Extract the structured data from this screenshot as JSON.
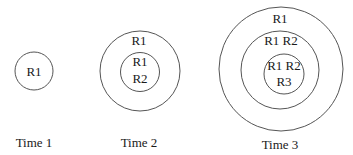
{
  "diagram": {
    "type": "nested-circles",
    "panels": [
      {
        "caption": "Time 1",
        "rings": [
          {
            "level": "outer",
            "labels": [
              "R1"
            ]
          }
        ]
      },
      {
        "caption": "Time 2",
        "rings": [
          {
            "level": "outer",
            "labels": [
              "R1"
            ]
          },
          {
            "level": "inner",
            "labels": [
              "R1",
              "R2"
            ]
          }
        ]
      },
      {
        "caption": "Time 3",
        "rings": [
          {
            "level": "outer",
            "labels": [
              "R1"
            ]
          },
          {
            "level": "middle",
            "labels": [
              "R1 R2"
            ]
          },
          {
            "level": "inner",
            "labels": [
              "R1 R2",
              "R3"
            ]
          }
        ]
      }
    ],
    "colors": {
      "stroke": "#555555",
      "text": "#1a1a1a",
      "background": "#ffffff"
    }
  },
  "text": {
    "t1_r1": "R1",
    "t1_caption": "Time 1",
    "t2_outer": "R1",
    "t2_inner_1": "R1",
    "t2_inner_2": "R2",
    "t2_caption": "Time 2",
    "t3_outer": "R1",
    "t3_middle": "R1 R2",
    "t3_inner_1": "R1 R2",
    "t3_inner_2": "R3",
    "t3_caption": "Time 3"
  }
}
